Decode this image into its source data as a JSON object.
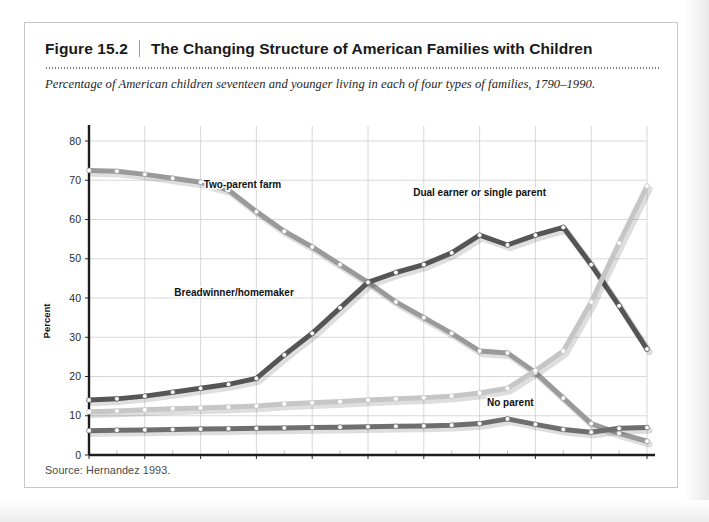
{
  "figure": {
    "number": "Figure 15.2",
    "separator": "|",
    "title": "The Changing Structure of American Families with Children",
    "subtitle": "Percentage of American children seventeen and younger living in each of four types of families, 1790–1990.",
    "source": "Source: Hernandez 1993."
  },
  "chart_data": {
    "type": "line",
    "title": "The Changing Structure of American Families with Children",
    "subtitle": "Percentage of American children seventeen and younger living in each of four types of families, 1790–1990.",
    "xlabel": "",
    "ylabel": "Percent",
    "xlim": [
      1790,
      1990
    ],
    "ylim": [
      0,
      80
    ],
    "yticks": [
      0,
      10,
      20,
      30,
      40,
      50,
      60,
      70,
      80
    ],
    "ytick_labels": [
      "0",
      "10",
      "20",
      "30",
      "40",
      "50",
      "60",
      "70",
      "80"
    ],
    "xticks": [
      1790,
      1810,
      1830,
      1850,
      1870,
      1890,
      1910,
      1930,
      1950,
      1970,
      1990
    ],
    "xtick_labels": [
      "1790",
      "1810",
      "1830",
      "1850",
      "1870",
      "1890",
      "1910",
      "1930",
      "1950",
      "1970",
      "1990"
    ],
    "x_minor_step": 10,
    "grid": true,
    "legend": "inline-labels",
    "markers": "white-filled-circles",
    "x": [
      1790,
      1800,
      1810,
      1820,
      1830,
      1840,
      1850,
      1860,
      1870,
      1880,
      1890,
      1900,
      1910,
      1920,
      1930,
      1940,
      1950,
      1960,
      1970,
      1980,
      1990
    ],
    "series": [
      {
        "name": "Two-parent farm",
        "color": "#9a9a9a",
        "label_x": 1845,
        "label_y": 68,
        "values": [
          72.5,
          72.3,
          71.5,
          70.5,
          69.5,
          67.5,
          62.0,
          57.0,
          53.0,
          48.5,
          44.0,
          39.0,
          35.0,
          31.0,
          26.5,
          26.0,
          21.0,
          14.5,
          8.0,
          5.5,
          3.5
        ]
      },
      {
        "name": "Breadwinner/homemaker",
        "color": "#555555",
        "label_x": 1842,
        "label_y": 40.5,
        "values": [
          14.0,
          14.3,
          15.0,
          16.0,
          17.0,
          18.0,
          19.5,
          25.5,
          31.0,
          37.5,
          44.0,
          46.5,
          48.5,
          51.5,
          56.0,
          53.5,
          56.0,
          58.0,
          48.5,
          38.0,
          27.0
        ]
      },
      {
        "name": "Dual earner or single parent",
        "color": "#c6c6c6",
        "label_x": 1930,
        "label_y": 66,
        "values": [
          11.0,
          11.2,
          11.5,
          11.8,
          12.0,
          12.2,
          12.5,
          13.0,
          13.3,
          13.6,
          14.0,
          14.3,
          14.6,
          15.0,
          15.8,
          17.0,
          21.5,
          26.5,
          39.0,
          54.0,
          68.5
        ]
      },
      {
        "name": "No parent",
        "color": "#6e6e6e",
        "label_x": 1941,
        "label_y": 12.5,
        "values": [
          6.2,
          6.3,
          6.4,
          6.5,
          6.6,
          6.7,
          6.8,
          6.9,
          7.0,
          7.1,
          7.2,
          7.3,
          7.4,
          7.6,
          8.0,
          9.2,
          7.8,
          6.5,
          5.8,
          6.8,
          7.0
        ]
      }
    ]
  },
  "axis": {
    "y_title": "Percent"
  }
}
